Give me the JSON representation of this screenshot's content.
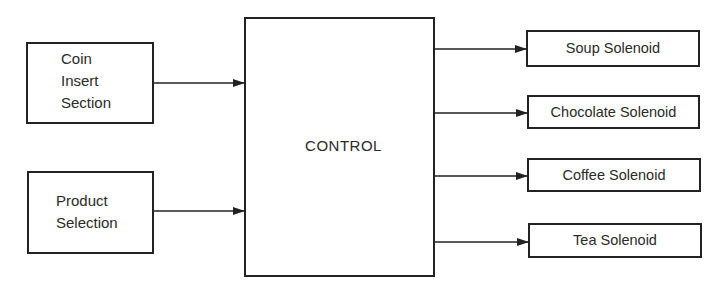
{
  "diagram": {
    "inputs": [
      {
        "id": "coin",
        "lines": [
          "Coin",
          "Insert",
          "Section"
        ]
      },
      {
        "id": "product",
        "lines": [
          "Product",
          "Selection"
        ]
      }
    ],
    "control": {
      "label": "CONTROL"
    },
    "outputs": [
      {
        "id": "soup",
        "label": "Soup Solenoid"
      },
      {
        "id": "chocolate",
        "label": "Chocolate Solenoid"
      },
      {
        "id": "coffee",
        "label": "Coffee Solenoid"
      },
      {
        "id": "tea",
        "label": "Tea Solenoid"
      }
    ],
    "colors": {
      "stroke": "#222222",
      "text": "#2a2a2a",
      "background": "#ffffff"
    }
  }
}
